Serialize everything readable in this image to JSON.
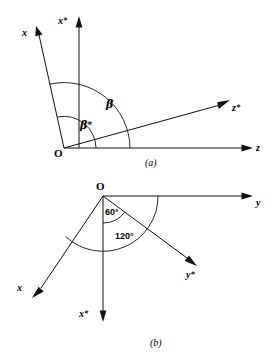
{
  "figure": {
    "background_color": "#ffffff",
    "line_color": "#111111"
  },
  "panel_a": {
    "caption": "(a)",
    "origin_label": "O",
    "axes": [
      {
        "name": "x-axis",
        "label": "x",
        "description": "original x axis, up and to the left"
      },
      {
        "name": "x-star-axis",
        "label": "x*",
        "description": "transformed x axis, vertical up"
      },
      {
        "name": "z-star-axis",
        "label": "z*",
        "description": "transformed z axis, up and to the right"
      },
      {
        "name": "z-axis",
        "label": "z",
        "description": "original z axis, horizontal right"
      }
    ],
    "angles": [
      {
        "name": "beta",
        "label": "β",
        "description": "angle between x axis and z-star axis"
      },
      {
        "name": "beta-star",
        "label": "β*",
        "description": "angle between x axis and x-star axis"
      }
    ]
  },
  "panel_b": {
    "caption": "(b)",
    "origin_label": "O",
    "axes": [
      {
        "name": "y-axis",
        "label": "y",
        "description": "original y axis, horizontal right"
      },
      {
        "name": "y-star-axis",
        "label": "y*",
        "description": "transformed y axis, down and to the right"
      },
      {
        "name": "x-axis",
        "label": "x",
        "description": "original x axis, down and to the left"
      },
      {
        "name": "x-star-axis",
        "label": "x*",
        "description": "transformed x axis, vertical down"
      }
    ],
    "angles": [
      {
        "name": "angle-60",
        "label": "60°",
        "description": "angle between y-star axis and x-star axis"
      },
      {
        "name": "angle-120",
        "label": "120°",
        "description": "angle between y axis and x axis"
      }
    ]
  }
}
